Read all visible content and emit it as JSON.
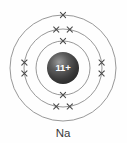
{
  "figure": {
    "element_label": "Na",
    "background_color": "#fefefe"
  },
  "nucleus": {
    "label": "11+",
    "charge_number": 11,
    "charge_sign": "+",
    "center_x": 63,
    "center_y": 68,
    "radius": 16,
    "fill_color": "#3b3b3b",
    "highlight_color": "#8a8a8a",
    "text_color": "#ffffff"
  },
  "chart_data": {
    "type": "diagram",
    "subtype": "bohr-atomic-model",
    "title": "Na",
    "element_symbol": "Na",
    "element_name": "Sodium",
    "atomic_number": 11,
    "nucleus_charge": "11+",
    "electron_configuration": "2, 8, 1",
    "total_electrons": 11,
    "ring_color": "#8c8c8c",
    "electron_color": "#4a4a4a",
    "electron_glyph": "x",
    "center": {
      "x": 63,
      "y": 68
    },
    "shells": [
      {
        "index": 1,
        "name": "K",
        "radius": 27,
        "electron_count": 2,
        "electron_angles_deg": [
          270,
          90
        ]
      },
      {
        "index": 2,
        "name": "L",
        "radius": 39,
        "electron_count": 8,
        "electron_angles_deg": [
          260,
          280,
          80,
          100,
          172,
          188,
          352,
          8
        ]
      },
      {
        "index": 3,
        "name": "M",
        "radius": 53,
        "electron_count": 1,
        "electron_angles_deg": [
          270
        ]
      }
    ]
  },
  "label": {
    "text": "Na",
    "x": 63,
    "y": 133,
    "color": "#3a3a3a"
  }
}
